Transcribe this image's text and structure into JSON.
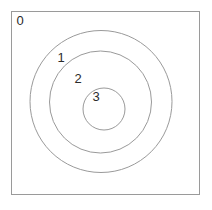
{
  "figure": {
    "title": "",
    "background_color": "#ffffff",
    "frame": {
      "name": "outer-frame",
      "label": "0",
      "x": 11,
      "y": 11,
      "width": 188,
      "height": 183,
      "stroke_color": "#9a9a9a",
      "fill_color": "#ffffff",
      "stroke_width": 1
    },
    "circles": [
      {
        "label": "1",
        "name": "circle-level-1",
        "cx": 101,
        "cy": 101.5,
        "r": 71,
        "stroke_color": "#9a9a9a",
        "stroke_width": 1,
        "fill": "none"
      },
      {
        "label": "2",
        "name": "circle-level-2",
        "cx": 100.5,
        "cy": 102,
        "r": 51,
        "stroke_color": "#9a9a9a",
        "stroke_width": 1,
        "fill": "none"
      },
      {
        "label": "3",
        "name": "circle-level-3",
        "cx": 104,
        "cy": 109,
        "r": 21,
        "stroke_color": "#9a9a9a",
        "stroke_width": 1,
        "fill": "none"
      }
    ],
    "labels": [
      {
        "text": "0",
        "name": "label-0",
        "x": 20,
        "y": 22,
        "color": "#2b2b2b",
        "font_size": 13
      },
      {
        "text": "1",
        "name": "label-1",
        "x": 61,
        "y": 59,
        "color": "#2b2b2b",
        "font_size": 13
      },
      {
        "text": "2",
        "name": "label-2",
        "x": 78,
        "y": 80,
        "color": "#2b2b2b",
        "font_size": 13
      },
      {
        "text": "3",
        "name": "label-3",
        "x": 96,
        "y": 98,
        "color": "#2b2b2b",
        "font_size": 13
      }
    ]
  }
}
